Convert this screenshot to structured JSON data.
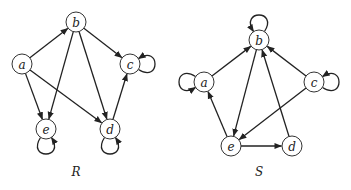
{
  "graphs": [
    {
      "id": "R",
      "label": "R",
      "label_pos": [
        76,
        176
      ],
      "nodes": [
        {
          "id": "a",
          "label": "a",
          "x": 22,
          "y": 64
        },
        {
          "id": "b",
          "label": "b",
          "x": 76,
          "y": 22
        },
        {
          "id": "c",
          "label": "c",
          "x": 130,
          "y": 64
        },
        {
          "id": "d",
          "label": "d",
          "x": 110,
          "y": 129
        },
        {
          "id": "e",
          "label": "e",
          "x": 46,
          "y": 129
        }
      ],
      "edges": [
        {
          "from": "a",
          "to": "b"
        },
        {
          "from": "a",
          "to": "e"
        },
        {
          "from": "a",
          "to": "d"
        },
        {
          "from": "b",
          "to": "c"
        },
        {
          "from": "b",
          "to": "e"
        },
        {
          "from": "b",
          "to": "d"
        },
        {
          "from": "d",
          "to": "c"
        }
      ],
      "loops": [
        {
          "node": "c",
          "side": "right"
        },
        {
          "node": "e",
          "side": "bottom"
        },
        {
          "node": "d",
          "side": "bottom"
        }
      ]
    },
    {
      "id": "S",
      "label": "S",
      "label_pos": [
        259,
        176
      ],
      "nodes": [
        {
          "id": "a",
          "label": "a",
          "x": 204,
          "y": 82
        },
        {
          "id": "b",
          "label": "b",
          "x": 259,
          "y": 40
        },
        {
          "id": "c",
          "label": "c",
          "x": 314,
          "y": 82
        },
        {
          "id": "d",
          "label": "d",
          "x": 292,
          "y": 146
        },
        {
          "id": "e",
          "label": "e",
          "x": 231,
          "y": 146
        }
      ],
      "edges": [
        {
          "from": "a",
          "to": "b"
        },
        {
          "from": "c",
          "to": "b"
        },
        {
          "from": "d",
          "to": "b"
        },
        {
          "from": "b",
          "to": "e"
        },
        {
          "from": "c",
          "to": "e"
        },
        {
          "from": "e",
          "to": "a"
        },
        {
          "from": "e",
          "to": "d"
        }
      ],
      "loops": [
        {
          "node": "a",
          "side": "left"
        },
        {
          "node": "b",
          "side": "top"
        },
        {
          "node": "c",
          "side": "right"
        }
      ]
    }
  ],
  "style": {
    "node_radius": 10,
    "stroke_color": "#222222",
    "background": "#ffffff"
  }
}
